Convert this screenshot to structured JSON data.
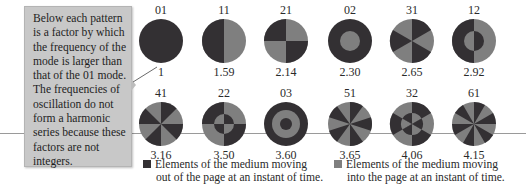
{
  "colors": {
    "out_of_page": "#333033",
    "into_page": "#7f7f7f",
    "callout_bg": "#c8c8c8"
  },
  "callout": {
    "text": "Below each pattern is a factor by which the frequency of the mode is larger than that of the 01 mode. The frequencies of oscillation do not form a harmonic series because these factors are not integers."
  },
  "modes": [
    {
      "label": "01",
      "factor": "1"
    },
    {
      "label": "11",
      "factor": "1.59"
    },
    {
      "label": "21",
      "factor": "2.14"
    },
    {
      "label": "02",
      "factor": "2.30"
    },
    {
      "label": "31",
      "factor": "2.65"
    },
    {
      "label": "12",
      "factor": "2.92"
    },
    {
      "label": "41",
      "factor": "3.16"
    },
    {
      "label": "22",
      "factor": "3.50"
    },
    {
      "label": "03",
      "factor": "3.60"
    },
    {
      "label": "51",
      "factor": "3.65"
    },
    {
      "label": "32",
      "factor": "4.06"
    },
    {
      "label": "61",
      "factor": "4.15"
    }
  ],
  "legend": {
    "out": {
      "line1": "Elements of the medium moving",
      "line2": "out of the page at an instant of time."
    },
    "in": {
      "line1": "Elements of the medium moving",
      "line2": "into the page at an instant of time."
    }
  }
}
